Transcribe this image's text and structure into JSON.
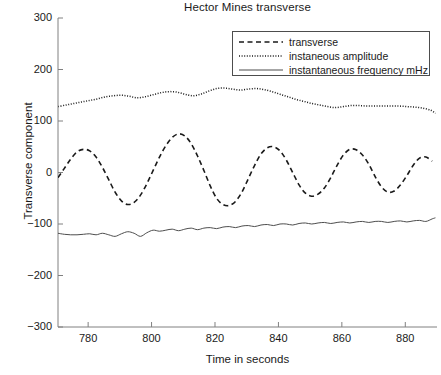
{
  "chart_data": {
    "type": "line",
    "title": "Hector Mines transverse",
    "xlabel": "Time in seconds",
    "ylabel": "Transverse component",
    "xlim": [
      770.5,
      890.0
    ],
    "ylim": [
      -300,
      300
    ],
    "xticks": [
      780,
      800,
      820,
      840,
      860,
      880
    ],
    "yticks": [
      300,
      200,
      100,
      0,
      -100,
      -200,
      -300
    ],
    "grid": false,
    "legend_position": "upper right",
    "series": [
      {
        "name": "transverse",
        "style": "dashed",
        "color": "#1a1a1a",
        "x": [
          770.5,
          772.5,
          774.5,
          776.5,
          778.5,
          780.5,
          782.5,
          784.5,
          786.5,
          788.5,
          790.5,
          792.5,
          794.5,
          796.5,
          798.5,
          800.5,
          802.5,
          804.5,
          806.5,
          808.5,
          810.5,
          812.5,
          814.5,
          816.5,
          818.5,
          820.5,
          822.5,
          824.5,
          826.5,
          828.5,
          830.5,
          832.5,
          834.5,
          836.5,
          838.5,
          840.5,
          842.5,
          844.5,
          846.5,
          848.5,
          850.5,
          852.5,
          854.5,
          856.5,
          858.5,
          860.5,
          862.5,
          864.5,
          866.5,
          868.5,
          870.5,
          872.5,
          874.5,
          876.5,
          878.5,
          880.5,
          882.5,
          884.5,
          886.5,
          888.5
        ],
        "y": [
          -10,
          8,
          26,
          40,
          45,
          42,
          30,
          10,
          -14,
          -38,
          -55,
          -62,
          -58,
          -44,
          -22,
          4,
          30,
          52,
          68,
          75,
          71,
          56,
          32,
          4,
          -26,
          -50,
          -62,
          -64,
          -56,
          -38,
          -12,
          14,
          36,
          48,
          50,
          42,
          24,
          0,
          -24,
          -40,
          -46,
          -42,
          -30,
          -10,
          14,
          34,
          45,
          44,
          34,
          16,
          -8,
          -28,
          -38,
          -36,
          -24,
          -6,
          14,
          28,
          30,
          22
        ]
      },
      {
        "name": "instaneous amplitude",
        "style": "dotted",
        "color": "#1a1a1a",
        "x": [
          770.5,
          773,
          775.5,
          778,
          780.5,
          783,
          785.5,
          788,
          790.5,
          793,
          795.5,
          798,
          800.5,
          803,
          805.5,
          808,
          810.5,
          813,
          815.5,
          818,
          820.5,
          823,
          825.5,
          828,
          830.5,
          833,
          835.5,
          838,
          840.5,
          843,
          845.5,
          848,
          850.5,
          853,
          855.5,
          858,
          860.5,
          863,
          865.5,
          868,
          870.5,
          873,
          875.5,
          878,
          880.5,
          883,
          885.5,
          888,
          889.5
        ],
        "y": [
          128,
          131,
          134,
          137,
          140,
          143,
          147,
          149,
          150,
          148,
          145,
          147,
          151,
          155,
          157,
          156,
          152,
          149,
          152,
          158,
          163,
          164,
          162,
          160,
          162,
          163,
          161,
          157,
          152,
          147,
          142,
          138,
          134,
          131,
          128,
          126,
          128,
          130,
          130,
          129,
          129,
          129,
          129,
          129,
          128,
          127,
          125,
          121,
          115
        ]
      },
      {
        "name": "instantaneous frequency mHz",
        "style": "solid",
        "color": "#4d4d4d",
        "x": [
          770.5,
          772.5,
          774.5,
          776.5,
          778.5,
          780.5,
          782.5,
          784.5,
          786.5,
          788.5,
          790.5,
          792.5,
          794.5,
          796.5,
          798.5,
          800.5,
          802.5,
          804.5,
          806.5,
          808.5,
          810.5,
          812.5,
          814.5,
          816.5,
          818.5,
          820.5,
          822.5,
          824.5,
          826.5,
          828.5,
          830.5,
          832.5,
          834.5,
          836.5,
          838.5,
          840.5,
          842.5,
          844.5,
          846.5,
          848.5,
          850.5,
          852.5,
          854.5,
          856.5,
          858.5,
          860.5,
          862.5,
          864.5,
          866.5,
          868.5,
          870.5,
          872.5,
          874.5,
          876.5,
          878.5,
          880.5,
          882.5,
          884.5,
          886.5,
          888.5,
          889.5
        ],
        "y": [
          -118,
          -120,
          -121,
          -121,
          -120,
          -119,
          -121,
          -118,
          -121,
          -124,
          -119,
          -115,
          -118,
          -124,
          -117,
          -112,
          -114,
          -112,
          -110,
          -113,
          -110,
          -108,
          -111,
          -108,
          -107,
          -109,
          -106,
          -105,
          -107,
          -104,
          -103,
          -105,
          -102,
          -101,
          -103,
          -100,
          -100,
          -102,
          -99,
          -98,
          -100,
          -98,
          -97,
          -99,
          -97,
          -96,
          -98,
          -96,
          -95,
          -97,
          -95,
          -95,
          -97,
          -95,
          -94,
          -96,
          -94,
          -93,
          -95,
          -90,
          -88
        ]
      }
    ]
  },
  "legend": {
    "entries": [
      {
        "label": "transverse",
        "style": "dashed"
      },
      {
        "label": "instaneous amplitude",
        "style": "dotted"
      },
      {
        "label": "instantaneous frequency mHz",
        "style": "solid"
      }
    ]
  }
}
